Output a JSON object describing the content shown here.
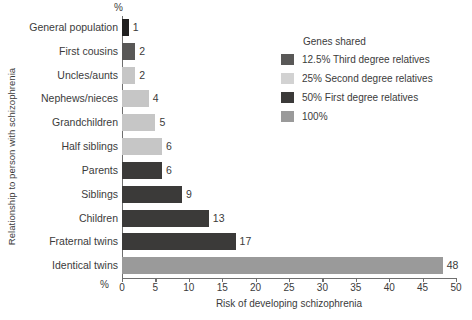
{
  "chart_data": {
    "type": "bar",
    "orientation": "horizontal",
    "title": "",
    "xlabel": "Risk of developing schizophrenia",
    "ylabel": "Relationship to person with schizophrenia",
    "x_unit_marker": "%",
    "xlim": [
      0,
      50
    ],
    "xticks": [
      0,
      5,
      10,
      15,
      20,
      25,
      30,
      35,
      40,
      45,
      50
    ],
    "xtick_labels": [
      "0",
      "5",
      "10",
      "15",
      "20",
      "25",
      "30",
      "35",
      "40",
      "45",
      "50"
    ],
    "grid": false,
    "legend_position": "upper-right",
    "categories": [
      "General population",
      "First cousins",
      "Uncles/aunts",
      "Nephews/nieces",
      "Grandchildren",
      "Half siblings",
      "Parents",
      "Siblings",
      "Children",
      "Fraternal twins",
      "Identical twins"
    ],
    "values": [
      1,
      2,
      2,
      4,
      5,
      6,
      6,
      9,
      13,
      17,
      48
    ],
    "value_labels": [
      "1",
      "2",
      "2",
      "4",
      "5",
      "6",
      "6",
      "9",
      "13",
      "17",
      "48"
    ],
    "bar_groups": [
      "12.5% Third degree relatives",
      "12.5% Third degree relatives",
      "25% Second degree relatives",
      "25% Second degree relatives",
      "25% Second degree relatives",
      "25% Second degree relatives",
      "50% First degree relatives",
      "50% First degree relatives",
      "50% First degree relatives",
      "50% First degree relatives",
      "100%"
    ],
    "bar_colors": [
      "#201f1f",
      "#595857",
      "#c6c6c6",
      "#c6c6c6",
      "#c6c6c6",
      "#c6c6c6",
      "#3b3a39",
      "#3b3a39",
      "#3b3a39",
      "#3b3a39",
      "#9a9a9a"
    ],
    "legend": {
      "title": "Genes shared",
      "entries": [
        {
          "label": "12.5% Third degree relatives",
          "color": "#595857"
        },
        {
          "label": "25% Second degree relatives",
          "color": "#d2d2d2"
        },
        {
          "label": "50% First degree relatives",
          "color": "#3b3a39"
        },
        {
          "label": "100%",
          "color": "#9a9a9a"
        }
      ]
    },
    "axis_color": "#6f6f6f",
    "text_color": "#3b3b3b"
  }
}
